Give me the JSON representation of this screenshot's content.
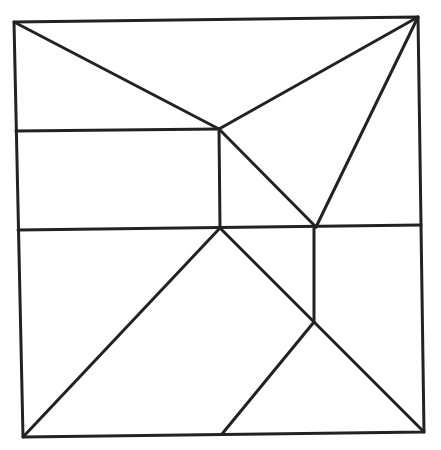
{
  "diagram": {
    "type": "square-dissection",
    "stroke_color": "#222222",
    "background": "#ffffff",
    "outer_square": [
      [
        14,
        22
      ],
      [
        418,
        17
      ],
      [
        424,
        432
      ],
      [
        23,
        437
      ]
    ],
    "segments": [
      {
        "name": "diag-top-left-to-A",
        "from": [
          14,
          22
        ],
        "to": [
          219,
          129
        ]
      },
      {
        "name": "diag-top-right-to-A",
        "from": [
          418,
          17
        ],
        "to": [
          219,
          129
        ]
      },
      {
        "name": "diag-top-right-to-C",
        "from": [
          418,
          17
        ],
        "to": [
          316,
          227
        ]
      },
      {
        "name": "horizontal-upper-left",
        "from": [
          16,
          131
        ],
        "to": [
          219,
          129
        ]
      },
      {
        "name": "vertical-A-to-B",
        "from": [
          219,
          129
        ],
        "to": [
          220,
          228
        ]
      },
      {
        "name": "diag-A-to-C",
        "from": [
          219,
          129
        ],
        "to": [
          316,
          227
        ]
      },
      {
        "name": "horizontal-middle",
        "from": [
          18,
          230
        ],
        "to": [
          421,
          225
        ]
      },
      {
        "name": "vertical-C-to-D",
        "from": [
          314,
          228
        ],
        "to": [
          314,
          322
        ]
      },
      {
        "name": "diag-B-to-bottom-left",
        "from": [
          220,
          228
        ],
        "to": [
          23,
          437
        ]
      },
      {
        "name": "diag-B-to-bottom-right",
        "from": [
          220,
          228
        ],
        "to": [
          424,
          432
        ]
      },
      {
        "name": "diag-D-to-E",
        "from": [
          314,
          322
        ],
        "to": [
          222,
          434
        ]
      }
    ]
  }
}
